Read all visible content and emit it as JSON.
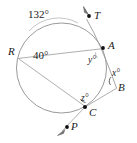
{
  "figure": {
    "type": "circle-geometry-diagram",
    "title": "",
    "stroke_color": "#8c8c8c",
    "text_color": "#1a1a1a",
    "background": "#ffffff",
    "circle": {
      "cx": 61.5,
      "cy": 68,
      "r": 45
    }
  },
  "points": [
    {
      "id": "T",
      "label": "T",
      "x": 89,
      "y": 16,
      "label_x": 94,
      "label_y": 10,
      "dot": true
    },
    {
      "id": "A",
      "label": "A",
      "x": 103,
      "y": 48,
      "label_x": 108,
      "label_y": 40,
      "dot": true
    },
    {
      "id": "B",
      "label": "B",
      "x": 116,
      "y": 87,
      "label_x": 118,
      "label_y": 82,
      "dot": false
    },
    {
      "id": "C",
      "label": "C",
      "x": 85,
      "y": 107,
      "label_x": 89,
      "label_y": 107,
      "dot": true
    },
    {
      "id": "P",
      "label": "P",
      "x": 67,
      "y": 127,
      "label_x": 71,
      "label_y": 121,
      "dot": true
    },
    {
      "id": "R",
      "label": "R",
      "x": 19,
      "y": 59,
      "label_x": 8,
      "label_y": 46,
      "dot": false
    }
  ],
  "angle_labels": [
    {
      "id": "arc-132",
      "text": "132°",
      "x": 28,
      "y": 9,
      "kind": "arc-measure"
    },
    {
      "id": "ang-40",
      "text": "40°",
      "x": 33,
      "y": 50,
      "kind": "inscribed-angle"
    },
    {
      "id": "ang-y",
      "text": "y°",
      "x": 88,
      "y": 56,
      "kind": "unknown-angle"
    },
    {
      "id": "ang-x",
      "text": "x°",
      "x": 112,
      "y": 69,
      "kind": "unknown-angle"
    },
    {
      "id": "ang-z",
      "text": "z°",
      "x": 81,
      "y": 94,
      "kind": "unknown-angle"
    }
  ],
  "segments": [
    {
      "id": "chord-RA",
      "from": "R",
      "to": "A",
      "note": "horizontal chord"
    },
    {
      "id": "chord-RC",
      "from": "R",
      "to": "C",
      "note": "chord"
    },
    {
      "id": "line-TAB",
      "from": "T",
      "to": "B",
      "note": "tangent through A"
    },
    {
      "id": "line-CB",
      "from": "C",
      "to": "B",
      "note": "secant ray"
    },
    {
      "id": "line-CP",
      "from": "C",
      "to": "P",
      "note": "ray with arrow"
    }
  ],
  "arrows": [
    {
      "id": "arrow-T",
      "at": "T",
      "direction": "up-left"
    },
    {
      "id": "arrow-P",
      "at": "P",
      "direction": "down-left"
    }
  ],
  "arc_markers": [
    {
      "id": "arc-mark-132",
      "desc": "minor arc from R-top to T side",
      "measure": "132°"
    },
    {
      "id": "arc-mark-x",
      "desc": "angle mark at B",
      "measure": "x°"
    },
    {
      "id": "arc-mark-z",
      "desc": "angle mark at C",
      "measure": "z°"
    }
  ]
}
